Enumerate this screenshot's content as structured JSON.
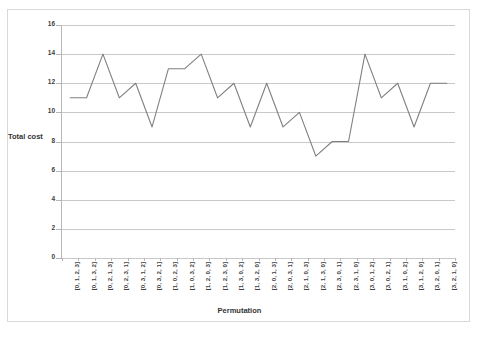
{
  "chart_data": {
    "type": "line",
    "title": "",
    "subtitle": "",
    "xlabel": "Permutation",
    "ylabel": "Total cost",
    "ylim": [
      0,
      16
    ],
    "yticks": [
      0,
      2,
      4,
      6,
      8,
      10,
      12,
      14,
      16
    ],
    "grid": true,
    "legend_position": "none",
    "line_color": "#808080",
    "categories": [
      "[0, 1, 2, 3]",
      "[0, 1, 3, 2]",
      "[0, 2, 1, 3]",
      "[0, 2, 3, 1]",
      "[0, 3, 1, 2]",
      "[0, 3, 2, 1]",
      "[1, 0, 2, 3]",
      "[1, 0, 3, 2]",
      "[1, 2, 0, 3]",
      "[1, 2, 3, 0]",
      "[1, 3, 0, 2]",
      "[1, 3, 2, 0]",
      "[2, 0, 1, 3]",
      "[2, 0, 3, 1]",
      "[2, 1, 0, 3]",
      "[2, 1, 3, 0]",
      "[2, 3, 0, 1]",
      "[2, 3, 1, 0]",
      "[3, 0, 1, 2]",
      "[3, 0, 2, 1]",
      "[3, 1, 0, 2]",
      "[3, 1, 2, 0]",
      "[3, 2, 0, 1]",
      "[3, 2, 1, 0]"
    ],
    "values": [
      11,
      11,
      14,
      11,
      12,
      9,
      13,
      13,
      14,
      11,
      12,
      9,
      12,
      9,
      10,
      7,
      8,
      8,
      14,
      11,
      12,
      9,
      12,
      12
    ],
    "series": [
      {
        "name": "Total cost",
        "values": [
          11,
          11,
          14,
          11,
          12,
          9,
          13,
          13,
          14,
          11,
          12,
          9,
          12,
          9,
          10,
          7,
          8,
          8,
          14,
          11,
          12,
          9,
          12,
          12
        ]
      }
    ]
  }
}
